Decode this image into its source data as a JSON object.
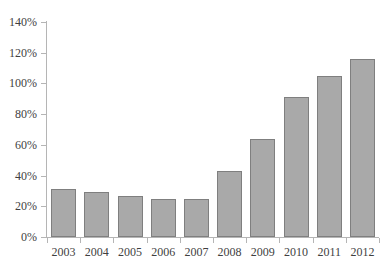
{
  "chart_data": {
    "type": "bar",
    "title": "",
    "subtitle": "",
    "xlabel": "",
    "ylabel": "",
    "categories": [
      "2003",
      "2004",
      "2005",
      "2006",
      "2007",
      "2008",
      "2009",
      "2010",
      "2011",
      "2012"
    ],
    "values": [
      31,
      29,
      27,
      24.5,
      24.5,
      43,
      64,
      91,
      105,
      116
    ],
    "value_labels": [
      "31%",
      "29%",
      "27%",
      "24.5%",
      "24.5%",
      "43%",
      "64%",
      "91%",
      "105%",
      "116%"
    ],
    "ylim": [
      0,
      140
    ],
    "ytick_values": [
      0,
      20,
      40,
      60,
      80,
      100,
      120,
      140
    ],
    "ytick_labels": [
      "0%",
      "20%",
      "40%",
      "60%",
      "80%",
      "100%",
      "120%",
      "140%"
    ],
    "grid": false,
    "legend": null,
    "legend_position": "none",
    "annotations": [],
    "series": [
      {
        "name": "",
        "values": [
          31,
          29,
          27,
          24.5,
          24.5,
          43,
          64,
          91,
          105,
          116
        ]
      }
    ],
    "colors": {
      "bar_fill": "#a9a9a9",
      "bar_border": "#7f7f7f",
      "axis": "#b5b5b5",
      "text": "#3f3f3f",
      "background": "#ffffff"
    }
  }
}
